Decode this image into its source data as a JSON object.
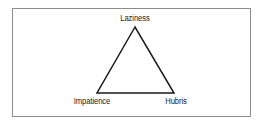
{
  "figure": {
    "type": "triangle-diagram",
    "background_color": "#ffffff",
    "frame": {
      "name": "figure-border",
      "color": "#8d8d8d",
      "stroke_width": 1
    },
    "shape": {
      "name": "triangle",
      "stroke_color": "#1a1a1a",
      "stroke_width": 1.5,
      "fill": "none",
      "points": "135,27 97,93 174,93"
    },
    "vertices": [
      {
        "id": "apex",
        "label": "Laziness",
        "x": 135,
        "y": 27
      },
      {
        "id": "bottom-left",
        "label": "Impatience",
        "x": 97,
        "y": 93
      },
      {
        "id": "bottom-right",
        "label": "Hubris",
        "x": 174,
        "y": 93
      }
    ]
  },
  "labels": {
    "top": "Laziness",
    "bottom_left": "Impatience",
    "bottom_right": "Hubris"
  }
}
